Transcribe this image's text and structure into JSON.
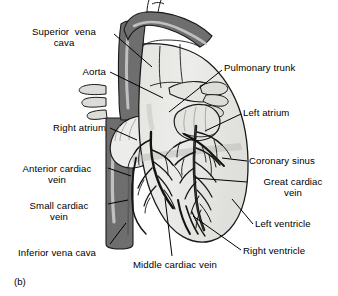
{
  "figure": {
    "caption": "(b)"
  },
  "colors": {
    "background": "#ffffff",
    "outline": "#1a1a1a",
    "heart_body": "#e8e8e4",
    "heart_shadow": "#cfcfcb",
    "vena_cava_dark": "#6e6e6e",
    "vena_cava_highlight": "#c9c9c9",
    "vessel_light": "#dcdcd8",
    "coronary_vessel": "#141414",
    "label_text": "#000000",
    "leader_line": "#000000"
  },
  "labels": [
    {
      "id": "superior-vena-cava",
      "lines": [
        "Superior  vena",
        "cava"
      ],
      "align": "center",
      "x": 14,
      "y": 26,
      "width": 100,
      "leader": {
        "x1": 114,
        "y1": 34,
        "x2": 152,
        "y2": 67
      }
    },
    {
      "id": "aorta",
      "lines": [
        "Aorta"
      ],
      "align": "right",
      "x": 44,
      "y": 66,
      "width": 62,
      "leader": {
        "x1": 110,
        "y1": 72,
        "x2": 163,
        "y2": 98
      }
    },
    {
      "id": "right-atrium",
      "lines": [
        "Right atrium"
      ],
      "align": "right",
      "x": 12,
      "y": 122,
      "width": 94,
      "leader": {
        "x1": 110,
        "y1": 128,
        "x2": 137,
        "y2": 140
      }
    },
    {
      "id": "anterior-cardiac-vein",
      "lines": [
        "Anterior cardiac",
        "vein"
      ],
      "align": "center",
      "x": 8,
      "y": 163,
      "width": 98,
      "leader": {
        "x1": 108,
        "y1": 168,
        "x2": 131,
        "y2": 176
      }
    },
    {
      "id": "small-cardiac-vein",
      "lines": [
        "Small cardiac",
        "vein"
      ],
      "align": "center",
      "x": 12,
      "y": 200,
      "width": 94,
      "leader": {
        "x1": 108,
        "y1": 204,
        "x2": 128,
        "y2": 200
      }
    },
    {
      "id": "inferior-vena-cava",
      "lines": [
        "Inferior vena cava"
      ],
      "align": "left",
      "x": 18,
      "y": 247,
      "width": 110,
      "leader": {
        "x1": 110,
        "y1": 244,
        "x2": 126,
        "y2": 223
      }
    },
    {
      "id": "middle-cardiac-vein",
      "lines": [
        "Middle cardiac vein"
      ],
      "align": "left",
      "x": 133,
      "y": 259,
      "width": 120,
      "leader": {
        "x1": 172,
        "y1": 256,
        "x2": 165,
        "y2": 198
      }
    },
    {
      "id": "pulmonary-trunk",
      "lines": [
        "Pulmonary trunk"
      ],
      "align": "left",
      "x": 224,
      "y": 62,
      "width": 110,
      "leader": {
        "x1": 222,
        "y1": 70,
        "x2": 169,
        "y2": 112
      }
    },
    {
      "id": "left-atrium",
      "lines": [
        "Left atrium"
      ],
      "align": "left",
      "x": 243,
      "y": 107,
      "width": 90,
      "leader": {
        "x1": 241,
        "y1": 114,
        "x2": 205,
        "y2": 131
      }
    },
    {
      "id": "coronary-sinus",
      "lines": [
        "Coronary sinus"
      ],
      "align": "left",
      "x": 249,
      "y": 155,
      "width": 88,
      "leader": {
        "x1": 247,
        "y1": 161,
        "x2": 222,
        "y2": 158
      }
    },
    {
      "id": "great-cardiac-vein",
      "lines": [
        "Great cardiac",
        "vein"
      ],
      "align": "center",
      "x": 249,
      "y": 176,
      "width": 88,
      "leader": {
        "x1": 247,
        "y1": 182,
        "x2": 195,
        "y2": 178
      }
    },
    {
      "id": "left-ventricle",
      "lines": [
        "Left ventricle"
      ],
      "align": "left",
      "x": 255,
      "y": 218,
      "width": 84,
      "leader": {
        "x1": 253,
        "y1": 224,
        "x2": 232,
        "y2": 199
      }
    },
    {
      "id": "right-ventricle",
      "lines": [
        "Right ventricle"
      ],
      "align": "left",
      "x": 243,
      "y": 245,
      "width": 92,
      "leader": {
        "x1": 241,
        "y1": 250,
        "x2": 193,
        "y2": 216
      }
    }
  ]
}
